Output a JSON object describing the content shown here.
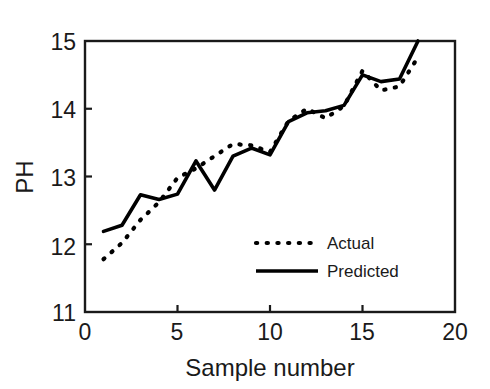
{
  "chart_data": {
    "type": "line",
    "title": "",
    "xlabel": "Sample number",
    "ylabel": "PH",
    "xlim": [
      0,
      20
    ],
    "ylim": [
      11,
      15
    ],
    "xticks": [
      0,
      5,
      10,
      15,
      20
    ],
    "yticks": [
      11,
      12,
      13,
      14,
      15
    ],
    "xtick_labels": [
      "0",
      "5",
      "10",
      "15",
      "20"
    ],
    "ytick_labels": [
      "11",
      "12",
      "13",
      "14",
      "15"
    ],
    "grid": false,
    "legend_position": "center-right-lower",
    "x": [
      1,
      2,
      3,
      4,
      5,
      6,
      7,
      8,
      9,
      10,
      11,
      12,
      13,
      14,
      15,
      16,
      17,
      18
    ],
    "series": [
      {
        "name": "Actual",
        "style": "dotted",
        "color": "#000000",
        "values": [
          11.78,
          12.02,
          12.36,
          12.62,
          12.98,
          13.12,
          13.3,
          13.48,
          13.46,
          13.36,
          13.82,
          14.0,
          13.86,
          14.04,
          14.56,
          14.27,
          14.33,
          14.76
        ]
      },
      {
        "name": "Predicted",
        "style": "solid",
        "color": "#000000",
        "values": [
          12.19,
          12.28,
          12.73,
          12.66,
          12.74,
          13.23,
          12.8,
          13.3,
          13.42,
          13.32,
          13.81,
          13.94,
          13.97,
          14.05,
          14.5,
          14.4,
          14.44,
          15.0
        ]
      }
    ]
  },
  "legend": {
    "entries": [
      {
        "label": "Actual",
        "style": "dotted"
      },
      {
        "label": "Predicted",
        "style": "solid"
      }
    ]
  },
  "axes": {
    "x_label": "Sample number",
    "y_label": "PH"
  }
}
